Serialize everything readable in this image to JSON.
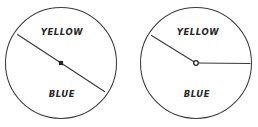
{
  "figure": {
    "type": "two-spinner-diagram",
    "background_color": "#ffffff",
    "ink_color": "#333333",
    "label_color": "#262626"
  },
  "spinners": [
    {
      "id": "spinner-left",
      "name": "left-spinner",
      "circle": {
        "cx": 61,
        "cy": 63,
        "r": 55.5
      },
      "center_dot": {
        "x": 61,
        "y": 63,
        "shape": "square",
        "size": 4.2,
        "fill": "#262626"
      },
      "pointers": [
        {
          "name": "diameter-line",
          "kind": "diameter",
          "angle_degrees": 205,
          "x1": 17.5,
          "y1": 34.5,
          "x2": 104.5,
          "y2": 91.5
        }
      ],
      "labels": [
        {
          "name": "label-yellow",
          "text": "YELLOW",
          "x": 62,
          "y": 32
        },
        {
          "name": "label-blue",
          "text": "BLUE",
          "x": 62,
          "y": 94
        }
      ]
    },
    {
      "id": "spinner-right",
      "name": "right-spinner",
      "circle": {
        "cx": 196,
        "cy": 63,
        "r": 55.5
      },
      "center_dot": {
        "x": 196,
        "y": 63,
        "shape": "circle-hollow",
        "size": 4.6,
        "fill": "#ffffff",
        "stroke": "#262626"
      },
      "pointers": [
        {
          "name": "pointer-arm-upper-left",
          "kind": "radius",
          "angle_degrees": 142,
          "x1": 196,
          "y1": 63,
          "x2": 151.5,
          "y2": 35.5
        },
        {
          "name": "pointer-arm-right",
          "kind": "radius",
          "angle_degrees": 0,
          "x1": 196,
          "y1": 63,
          "x2": 250,
          "y2": 63.5
        }
      ],
      "labels": [
        {
          "name": "label-yellow",
          "text": "YELLOW",
          "x": 198,
          "y": 32
        },
        {
          "name": "label-blue",
          "text": "BLUE",
          "x": 197,
          "y": 94
        }
      ]
    }
  ]
}
